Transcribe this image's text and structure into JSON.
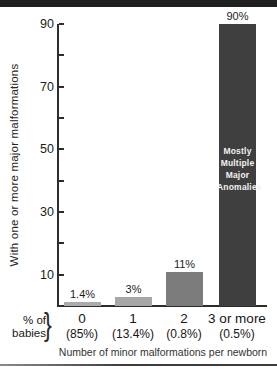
{
  "chart_data": {
    "type": "bar",
    "categories": [
      "0",
      "1",
      "2",
      "3 or more"
    ],
    "values": [
      1.4,
      3,
      11,
      90
    ],
    "bar_labels": [
      "1.4%",
      "3%",
      "11%",
      "90%"
    ],
    "bar_colors": [
      "#ababab",
      "#a7a7a7",
      "#7c7c7c",
      "#3f3f3f"
    ],
    "pct_of_babies_caption": "% of\nbabies",
    "pct_of_babies": [
      "(85%)",
      "(13.4%)",
      "(0.8%)",
      "(0.5%)"
    ],
    "ylabel": "With one or more major malformations",
    "xlabel": "Number of minor malformations per newborn",
    "ylim": [
      0,
      90
    ],
    "ytick_labels": [
      90,
      70,
      50,
      30,
      10
    ],
    "ytick_minor_step": 10,
    "grid": false,
    "legend_position": "none",
    "bar3_annotation": "Mostly\nMultiple\nMajor\nAnomalies"
  },
  "decor": {
    "brace": "}"
  }
}
